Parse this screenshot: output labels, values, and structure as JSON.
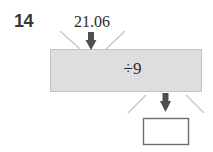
{
  "problem": {
    "number": "14",
    "input_value": "21.06",
    "operation": "÷9",
    "answer_value": "",
    "answer_placeholder": ""
  },
  "colors": {
    "background": "#ffffff",
    "machine_fill": "#dedede",
    "machine_border": "#c2c2c2",
    "funnel_line": "#c9c9c9",
    "arrow": "#4f4f4f",
    "answer_box_border": "#6d6d6d",
    "number_text": "#3a3a3a",
    "body_text": "#2b2b2b"
  },
  "icons": {
    "input_arrow": "arrow-down-icon",
    "output_arrow": "arrow-down-icon"
  }
}
